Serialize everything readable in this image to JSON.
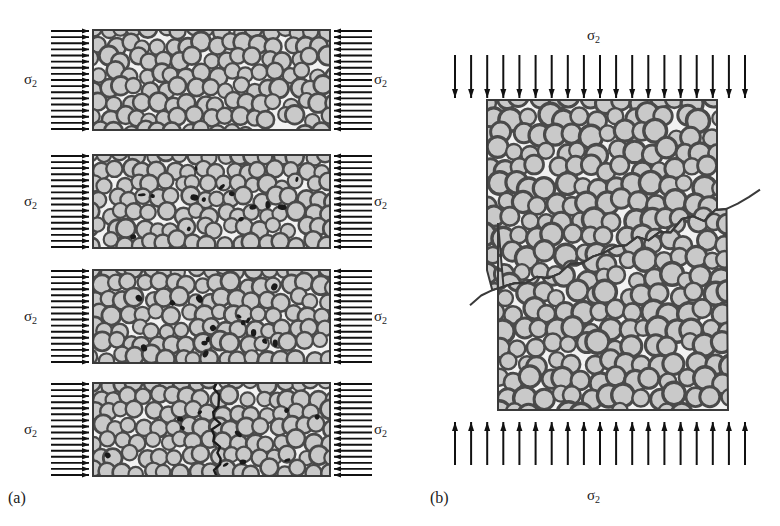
{
  "figure": {
    "kind": "materials-science-schematic",
    "background_color": "#ffffff",
    "grain_fill_color": "#c9c9c9",
    "grain_stroke_color": "#4a4a4a",
    "block_fill_color": "#f2f2f2",
    "block_stroke_color": "#3a3a3a",
    "arrow_color": "#111111",
    "crack_color": "#1a1a1a"
  },
  "panels": [
    {
      "id": "a",
      "caption": "(a)",
      "caption_x": 8,
      "caption_y": 489,
      "loading_mode": "uniaxial-tension-horizontal",
      "stages": [
        {
          "index": 0,
          "name": "stage-intact",
          "x": 93,
          "y": 30,
          "width": 237,
          "height": 100,
          "void_count": 0,
          "crack": "none",
          "left_label": {
            "text": "σ",
            "sub": "2",
            "x": 24,
            "y": 72
          },
          "right_label": {
            "text": "σ",
            "sub": "2",
            "x": 374,
            "y": 72
          },
          "arrows": {
            "left_count": 17,
            "right_count": 17,
            "direction": "inward"
          }
        },
        {
          "index": 1,
          "name": "stage-void-nucleation",
          "x": 93,
          "y": 155,
          "width": 237,
          "height": 93,
          "void_count": 14,
          "crack": "none",
          "left_label": {
            "text": "σ",
            "sub": "2",
            "x": 24,
            "y": 194
          },
          "right_label": {
            "text": "σ",
            "sub": "2",
            "x": 374,
            "y": 194
          },
          "arrows": {
            "left_count": 16,
            "right_count": 16,
            "direction": "inward"
          }
        },
        {
          "index": 2,
          "name": "stage-void-coalescence",
          "x": 93,
          "y": 270,
          "width": 237,
          "height": 93,
          "void_count": 16,
          "crack": "none",
          "left_label": {
            "text": "σ",
            "sub": "2",
            "x": 24,
            "y": 309
          },
          "right_label": {
            "text": "σ",
            "sub": "2",
            "x": 374,
            "y": 309
          },
          "arrows": {
            "left_count": 16,
            "right_count": 16,
            "direction": "inward"
          }
        },
        {
          "index": 3,
          "name": "stage-crack-formation",
          "x": 93,
          "y": 383,
          "width": 237,
          "height": 93,
          "void_count": 10,
          "crack": "vertical-centre",
          "left_label": {
            "text": "σ",
            "sub": "2",
            "x": 24,
            "y": 422
          },
          "right_label": {
            "text": "σ",
            "sub": "2",
            "x": 374,
            "y": 422
          },
          "arrows": {
            "left_count": 16,
            "right_count": 16,
            "direction": "inward"
          }
        }
      ]
    },
    {
      "id": "b",
      "caption": "(b)",
      "caption_x": 430,
      "caption_y": 489,
      "loading_mode": "uniaxial-compression-vertical",
      "top_label": {
        "text": "σ",
        "sub": "2",
        "x": 587,
        "y": 28
      },
      "bottom_label": {
        "text": "σ",
        "sub": "2",
        "x": 587,
        "y": 488
      },
      "top_arrows": {
        "count": 19,
        "direction": "down",
        "y_start": 55,
        "y_end": 98,
        "x_start": 455,
        "x_end": 745
      },
      "bottom_arrows": {
        "count": 19,
        "direction": "up",
        "y_start": 465,
        "y_end": 422,
        "x_start": 455,
        "x_end": 745
      },
      "upper_block": {
        "x": 487,
        "y": 100,
        "width": 230,
        "height": 185
      },
      "lower_block": {
        "x": 498,
        "y": 205,
        "width": 230,
        "height": 205
      },
      "fracture": "diagonal-jagged-shear-plane",
      "grain_count_upper": 120,
      "grain_count_lower": 120
    }
  ]
}
